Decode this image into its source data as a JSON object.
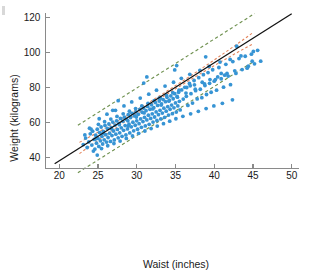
{
  "chart_data": {
    "type": "scatter",
    "title": "",
    "xlabel": "Waist (inches)",
    "ylabel": "Weight (kilograms)",
    "xlim": [
      18.2,
      51.0
    ],
    "ylim": [
      30.0,
      124.0
    ],
    "xticks": [
      20,
      25,
      30,
      35,
      40,
      45,
      50
    ],
    "xtick_labels": [
      "20",
      "25",
      "30",
      "35",
      "40",
      "45",
      "50"
    ],
    "yticks": [
      40,
      60,
      80,
      100,
      120
    ],
    "ytick_labels": [
      "40",
      "60",
      "80",
      "100",
      "120"
    ],
    "grid": false,
    "legend": "none",
    "point_color": "#3794d4",
    "point_radius": 1.9,
    "n_points": 252,
    "series": [
      {
        "name": "observations",
        "x": [
          23.1,
          23.4,
          23.6,
          23.8,
          24.0,
          24.2,
          24.3,
          24.5,
          24.6,
          24.7,
          24.8,
          24.9,
          25.0,
          25.1,
          25.2,
          25.3,
          25.4,
          25.5,
          25.6,
          25.7,
          25.8,
          25.9,
          26.0,
          26.1,
          26.2,
          26.3,
          26.4,
          26.5,
          26.6,
          26.7,
          26.8,
          26.9,
          27.0,
          27.1,
          27.2,
          27.3,
          27.4,
          27.5,
          27.6,
          27.7,
          27.8,
          27.9,
          28.0,
          28.1,
          28.2,
          28.3,
          28.4,
          28.5,
          28.6,
          28.7,
          28.8,
          28.9,
          29.0,
          29.1,
          29.2,
          29.3,
          29.4,
          29.5,
          29.6,
          29.7,
          29.8,
          29.9,
          30.0,
          30.1,
          30.2,
          30.3,
          30.4,
          30.5,
          30.6,
          30.7,
          30.8,
          30.9,
          31.0,
          31.1,
          31.2,
          31.3,
          31.4,
          31.5,
          31.6,
          31.7,
          31.8,
          31.9,
          32.0,
          32.1,
          32.2,
          32.3,
          32.4,
          32.5,
          32.6,
          32.7,
          32.8,
          32.9,
          33.0,
          33.1,
          33.2,
          33.3,
          33.4,
          33.5,
          33.6,
          33.7,
          33.8,
          33.9,
          34.0,
          34.1,
          34.2,
          34.3,
          34.4,
          34.5,
          34.6,
          34.7,
          34.8,
          34.9,
          35.0,
          35.1,
          35.2,
          35.3,
          35.4,
          35.5,
          35.6,
          35.8,
          36.0,
          36.2,
          36.4,
          36.6,
          36.8,
          37.0,
          37.2,
          37.4,
          37.6,
          37.8,
          38.0,
          38.2,
          38.4,
          38.6,
          38.8,
          39.0,
          39.2,
          39.4,
          39.6,
          39.8,
          40.0,
          40.3,
          40.6,
          40.9,
          41.2,
          41.5,
          41.8,
          42.1,
          42.4,
          42.8,
          43.2,
          43.6,
          44.0,
          44.4,
          44.8,
          45.2,
          45.6,
          46.0,
          24.1,
          24.4,
          25.05,
          25.45,
          25.85,
          26.25,
          26.65,
          27.05,
          27.45,
          27.85,
          28.25,
          28.65,
          29.05,
          29.45,
          29.85,
          30.25,
          30.65,
          31.05,
          31.45,
          31.85,
          32.25,
          32.65,
          33.05,
          33.45,
          33.85,
          34.25,
          34.65,
          35.05,
          35.45,
          35.95,
          36.45,
          36.95,
          37.45,
          37.95,
          38.45,
          38.95,
          39.45,
          39.95,
          40.45,
          41.05,
          41.65,
          42.35,
          23.3,
          23.9,
          24.65,
          25.15,
          25.65,
          26.15,
          26.75,
          27.25,
          27.75,
          28.35,
          28.85,
          29.35,
          29.95,
          30.45,
          30.95,
          31.55,
          32.05,
          32.55,
          33.15,
          33.65,
          34.15,
          34.75,
          35.25,
          35.75,
          36.35,
          36.85,
          37.55,
          38.15,
          38.75,
          39.35,
          40.15,
          40.75,
          41.35,
          42.05,
          42.65,
          43.45,
          44.25,
          45.05,
          24.9,
          26.9,
          28.9,
          30.9,
          32.9,
          34.9,
          36.9,
          38.9,
          40.9,
          42.9,
          44.9,
          27.6,
          31.3,
          35.15
        ],
        "y": [
          47.5,
          51.2,
          45.8,
          49.0,
          53.6,
          47.2,
          55.1,
          50.4,
          44.9,
          52.8,
          48.3,
          56.2,
          51.0,
          46.4,
          54.3,
          49.6,
          57.5,
          52.1,
          47.8,
          55.0,
          50.2,
          58.4,
          53.1,
          48.9,
          56.7,
          51.5,
          59.2,
          54.0,
          49.3,
          57.1,
          52.6,
          60.3,
          55.2,
          50.1,
          58.6,
          53.4,
          61.0,
          56.1,
          51.3,
          59.5,
          54.2,
          62.4,
          57.0,
          52.2,
          60.8,
          55.6,
          63.1,
          58.3,
          53.0,
          61.7,
          56.4,
          64.5,
          59.1,
          54.1,
          62.9,
          57.6,
          65.3,
          60.2,
          55.3,
          63.8,
          58.5,
          66.1,
          61.0,
          56.2,
          64.7,
          59.4,
          67.5,
          62.1,
          57.3,
          65.9,
          60.6,
          68.3,
          63.0,
          58.1,
          66.8,
          61.5,
          69.2,
          64.2,
          59.0,
          67.6,
          62.4,
          70.1,
          65.0,
          60.3,
          68.5,
          63.2,
          71.4,
          66.1,
          61.2,
          69.8,
          64.5,
          72.3,
          67.0,
          62.1,
          70.6,
          65.4,
          73.1,
          68.2,
          63.0,
          71.9,
          66.5,
          74.4,
          69.1,
          64.3,
          72.8,
          67.6,
          75.2,
          70.0,
          65.1,
          73.6,
          68.4,
          76.5,
          71.2,
          66.0,
          74.9,
          69.5,
          77.3,
          72.1,
          67.2,
          78.6,
          73.4,
          80.1,
          75.0,
          69.8,
          82.3,
          76.5,
          71.1,
          84.0,
          78.2,
          73.5,
          85.6,
          79.0,
          74.2,
          87.3,
          81.1,
          76.0,
          88.5,
          82.4,
          77.3,
          90.1,
          83.6,
          78.5,
          91.4,
          85.0,
          80.2,
          93.2,
          86.5,
          81.6,
          94.8,
          88.0,
          96.5,
          90.2,
          97.8,
          92.1,
          99.0,
          93.5,
          101.2,
          95.0,
          56.3,
          43.8,
          59.0,
          45.2,
          60.5,
          46.8,
          62.0,
          48.1,
          63.5,
          49.5,
          65.0,
          51.0,
          66.5,
          52.4,
          68.0,
          53.9,
          69.5,
          55.2,
          71.0,
          56.6,
          72.5,
          58.0,
          74.0,
          59.4,
          75.5,
          60.8,
          77.0,
          62.2,
          78.5,
          63.6,
          80.0,
          65.0,
          81.5,
          66.4,
          83.0,
          68.0,
          84.5,
          69.5,
          86.0,
          71.0,
          88.0,
          73.0,
          53.0,
          56.8,
          50.6,
          62.2,
          54.0,
          64.8,
          56.5,
          67.0,
          58.8,
          69.5,
          61.0,
          71.8,
          63.2,
          74.0,
          65.5,
          76.2,
          67.8,
          78.5,
          70.0,
          80.8,
          72.2,
          83.0,
          74.5,
          85.2,
          76.8,
          87.5,
          79.0,
          89.8,
          82.0,
          92.0,
          84.5,
          94.5,
          87.0,
          96.0,
          89.5,
          98.0,
          91.0,
          100.5,
          41.5,
          67.0,
          58.0,
          82.5,
          74.0,
          90.0,
          81.0,
          97.5,
          88.0,
          103.5,
          95.0,
          72.5,
          86.0,
          92.5
        ]
      }
    ],
    "regression_line": {
      "name": "least-squares fit",
      "color": "#111111",
      "style": "solid",
      "x_start": 19.4,
      "x_end": 50.0,
      "y_start": 36.6,
      "y_end": 122.0
    },
    "confidence_bands": {
      "name": "confidence interval for mean response",
      "color": "#e4835a",
      "style": "dashed",
      "x_start": 22.6,
      "x_end": 45.0,
      "half_width_center": 0.9,
      "half_width_edge": 3.2
    },
    "prediction_bands": {
      "name": "prediction interval for individual response",
      "color": "#6f9150",
      "style": "dashed",
      "x_start": 22.4,
      "x_end": 45.2,
      "half_width": 13.5
    },
    "annotations": []
  },
  "axes": {
    "x_axis_name": "waist-axis",
    "y_axis_name": "weight-axis"
  }
}
